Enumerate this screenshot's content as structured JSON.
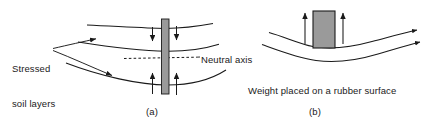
{
  "figure": {
    "background_color": "#ffffff",
    "ink_color": "#1a1a1a",
    "fill_color": "#9a9a9a",
    "panels": [
      {
        "id": "a",
        "caption": "(a)",
        "labels": {
          "stressed_soil_layers": "Stressed\nsoil layers",
          "neutral_axis": "Neutral axis"
        },
        "elements": {
          "column_label": "vertical-pile",
          "down_arrows": 2,
          "up_arrows": 2,
          "soil_layer_curves": 3,
          "neutral_axis_style": "dashed"
        }
      },
      {
        "id": "b",
        "caption": "(b)",
        "labels": {
          "description": "Weight placed on a rubber surface"
        },
        "elements": {
          "block_label": "weight-block",
          "up_arrows": 2,
          "rubber_surface_curves": 2
        }
      }
    ]
  },
  "text": {
    "stressed_soil_layers_line1": "Stressed",
    "stressed_soil_layers_line2": "soil layers",
    "neutral_axis": "Neutral axis",
    "weight_rubber_surface": "Weight placed on a rubber surface",
    "caption_a": "(a)",
    "caption_b": "(b)"
  }
}
